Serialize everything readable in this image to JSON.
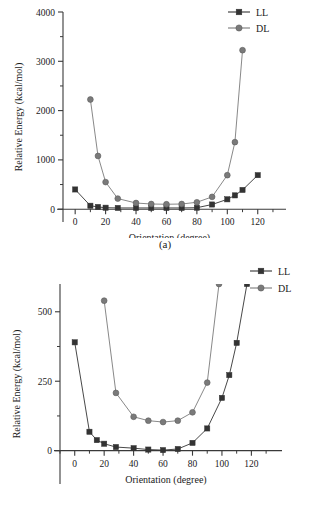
{
  "figure": {
    "panels": [
      {
        "caption": "(a)",
        "chart_ref": 0
      },
      {
        "caption": "(b)",
        "chart_ref": 1
      }
    ]
  },
  "colors": {
    "ll": "#333333",
    "dl": "#7a7a7a",
    "axis": "#3a3a3a",
    "background": "#ffffff"
  },
  "chart_data": [
    {
      "type": "line",
      "title": "",
      "xlabel": "Orientation (degree)",
      "ylabel": "Relative Energy (kcal/mol)",
      "xlim": [
        -8,
        132
      ],
      "ylim": [
        -260,
        4000
      ],
      "xticks": [
        0,
        20,
        40,
        60,
        80,
        100,
        120
      ],
      "xticklabels": [
        "0",
        "20",
        "40",
        "60",
        "80",
        "100",
        "120"
      ],
      "yticks": [
        0,
        1000,
        2000,
        3000,
        4000
      ],
      "yticklabels": [
        "0",
        "1000",
        "2000",
        "3000",
        "4000"
      ],
      "grid": false,
      "legend_position": "top-right",
      "series": [
        {
          "name": "LL",
          "marker": "square",
          "color": "#333333",
          "x": [
            0,
            10,
            15,
            20,
            28,
            40,
            50,
            60,
            70,
            80,
            90,
            100,
            105,
            110,
            120
          ],
          "y": [
            400,
            70,
            45,
            30,
            25,
            25,
            25,
            25,
            25,
            30,
            95,
            200,
            280,
            390,
            690
          ]
        },
        {
          "name": "DL",
          "marker": "circle",
          "color": "#7a7a7a",
          "x": [
            10,
            15,
            20,
            28,
            40,
            50,
            60,
            70,
            80,
            90,
            100,
            105,
            110
          ],
          "y": [
            2225,
            1080,
            550,
            215,
            125,
            105,
            100,
            105,
            140,
            250,
            690,
            1360,
            3225
          ]
        }
      ]
    },
    {
      "type": "line",
      "title": "",
      "xlabel": "Orientation (degree)",
      "ylabel": "Relative Energy (kcal/mol)",
      "xlim": [
        -10,
        134
      ],
      "ylim": [
        -120,
        600
      ],
      "xticks": [
        0,
        20,
        40,
        60,
        80,
        100,
        120
      ],
      "xticklabels": [
        "0",
        "20",
        "40",
        "60",
        "80",
        "100",
        "120"
      ],
      "yticks": [
        0,
        250,
        500
      ],
      "yticklabels": [
        "0",
        "250",
        "500"
      ],
      "grid": false,
      "legend_position": "top-right",
      "series": [
        {
          "name": "LL",
          "marker": "square",
          "color": "#333333",
          "x": [
            0,
            10,
            15,
            20,
            28,
            40,
            50,
            60,
            70,
            80,
            90,
            100,
            105,
            110,
            117
          ],
          "y": [
            390,
            68,
            38,
            25,
            13,
            9,
            4,
            2,
            6,
            28,
            80,
            190,
            272,
            388,
            600
          ]
        },
        {
          "name": "DL",
          "marker": "circle",
          "color": "#7a7a7a",
          "x": [
            20,
            28,
            40,
            50,
            60,
            70,
            80,
            90,
            98
          ],
          "y": [
            540,
            208,
            122,
            108,
            103,
            108,
            138,
            245,
            600
          ]
        }
      ]
    }
  ],
  "legend": {
    "items": [
      {
        "label": "LL",
        "marker": "square",
        "color": "#333333"
      },
      {
        "label": "DL",
        "marker": "circle",
        "color": "#7a7a7a"
      }
    ]
  }
}
